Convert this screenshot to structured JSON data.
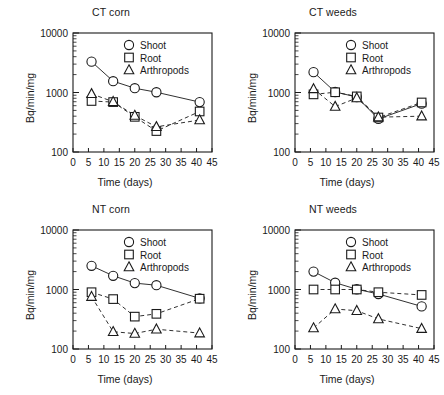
{
  "figure": {
    "panel_count": 4,
    "shared_xlabel": "Time (days)",
    "shared_ylabel": "Bq/min/mg",
    "legend_labels": [
      "Shoot",
      "Root",
      "Arthropods"
    ],
    "marker_shapes": [
      "circle",
      "square",
      "triangle"
    ],
    "line_styles": [
      "solid",
      "dashed",
      "dashed"
    ],
    "ink_color": "#1a1a1a",
    "background_color": "#ffffff"
  },
  "chart_data": [
    {
      "type": "line",
      "title": "CT corn",
      "xlabel": "Time (days)",
      "ylabel": "Bq/min/mg",
      "yscale": "log",
      "ylim": [
        100,
        10000
      ],
      "xlim": [
        0,
        45
      ],
      "xticks": [
        0,
        5,
        10,
        15,
        20,
        25,
        30,
        35,
        40,
        45
      ],
      "yticks": [
        100,
        1000,
        10000
      ],
      "ytick_labels": [
        "100",
        "1000",
        "10000"
      ],
      "grid": false,
      "legend_position": "top-right",
      "x": [
        6,
        13,
        20,
        27,
        41
      ],
      "series": [
        {
          "name": "Shoot",
          "marker": "circle",
          "line": "solid",
          "values": [
            3300,
            1550,
            1180,
            1010,
            690
          ]
        },
        {
          "name": "Root",
          "marker": "square",
          "line": "dashed",
          "values": [
            720,
            690,
            390,
            225,
            480
          ]
        },
        {
          "name": "Arthropods",
          "marker": "triangle",
          "line": "dashed",
          "values": [
            950,
            700,
            410,
            265,
            345
          ]
        }
      ]
    },
    {
      "type": "line",
      "title": "CT weeds",
      "xlabel": "Time (days)",
      "ylabel": "Bq/min/mg",
      "yscale": "log",
      "ylim": [
        100,
        10000
      ],
      "xlim": [
        0,
        45
      ],
      "xticks": [
        0,
        5,
        10,
        15,
        20,
        25,
        30,
        35,
        40,
        45
      ],
      "yticks": [
        100,
        1000,
        10000
      ],
      "ytick_labels": [
        "100",
        "1000",
        "10000"
      ],
      "grid": false,
      "legend_position": "top-right",
      "x": [
        6,
        13,
        20,
        27,
        41
      ],
      "series": [
        {
          "name": "Shoot",
          "marker": "circle",
          "line": "solid",
          "values": [
            2200,
            1020,
            840,
            360,
            650
          ]
        },
        {
          "name": "Root",
          "marker": "square",
          "line": "dashed",
          "values": [
            930,
            1010,
            860,
            380,
            680
          ]
        },
        {
          "name": "Arthropods",
          "marker": "triangle",
          "line": "dashed",
          "values": [
            1150,
            580,
            810,
            385,
            400
          ]
        }
      ]
    },
    {
      "type": "line",
      "title": "NT corn",
      "xlabel": "Time (days)",
      "ylabel": "Bq/min/mg",
      "yscale": "log",
      "ylim": [
        100,
        10000
      ],
      "xlim": [
        0,
        45
      ],
      "xticks": [
        0,
        5,
        10,
        15,
        20,
        25,
        30,
        35,
        40,
        45
      ],
      "yticks": [
        100,
        1000,
        10000
      ],
      "ytick_labels": [
        "100",
        "1000",
        "10000"
      ],
      "grid": false,
      "legend_position": "top-right",
      "x": [
        6,
        13,
        20,
        27,
        41
      ],
      "series": [
        {
          "name": "Shoot",
          "marker": "circle",
          "line": "solid",
          "values": [
            2500,
            1700,
            1280,
            1180,
            710
          ]
        },
        {
          "name": "Root",
          "marker": "square",
          "line": "dashed",
          "values": [
            900,
            690,
            350,
            390,
            700
          ]
        },
        {
          "name": "Arthropods",
          "marker": "triangle",
          "line": "dashed",
          "values": [
            760,
            195,
            182,
            215,
            185
          ]
        }
      ]
    },
    {
      "type": "line",
      "title": "NT weeds",
      "xlabel": "Time (days)",
      "ylabel": "Bq/min/mg",
      "yscale": "log",
      "ylim": [
        100,
        10000
      ],
      "xlim": [
        0,
        45
      ],
      "xticks": [
        0,
        5,
        10,
        15,
        20,
        25,
        30,
        35,
        40,
        45
      ],
      "yticks": [
        100,
        1000,
        10000
      ],
      "ytick_labels": [
        "100",
        "1000",
        "10000"
      ],
      "grid": false,
      "legend_position": "top-right",
      "x": [
        6,
        13,
        20,
        27,
        41
      ],
      "series": [
        {
          "name": "Shoot",
          "marker": "circle",
          "line": "solid",
          "values": [
            2000,
            1300,
            1010,
            840,
            520
          ]
        },
        {
          "name": "Root",
          "marker": "square",
          "line": "dashed",
          "values": [
            1000,
            1000,
            1000,
            900,
            810
          ]
        },
        {
          "name": "Arthropods",
          "marker": "triangle",
          "line": "dashed",
          "values": [
            225,
            470,
            440,
            320,
            220
          ]
        }
      ]
    }
  ]
}
